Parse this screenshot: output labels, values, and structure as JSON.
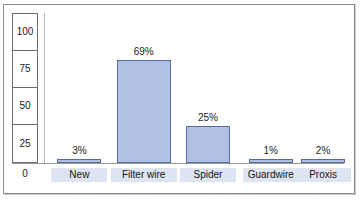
{
  "chart_data": {
    "type": "bar",
    "title": "",
    "xlabel": "",
    "ylabel": "",
    "categories": [
      "New",
      "Filter wire",
      "Spider",
      "Guardwire",
      "Proxis"
    ],
    "values": [
      3,
      69,
      25,
      1,
      2
    ],
    "value_labels": [
      "3%",
      "69%",
      "25%",
      "1%",
      "2%"
    ],
    "yticks": [
      "100",
      "75",
      "50",
      "25"
    ],
    "y_zero_label": "0",
    "ylim": [
      0,
      100
    ],
    "grid": false,
    "legend": "none",
    "bar_fill": "#b0c0e2",
    "bar_border": "#5a6b9a",
    "category_label_bg": "#dde4f2",
    "frame_color": "#8a8a8a"
  }
}
